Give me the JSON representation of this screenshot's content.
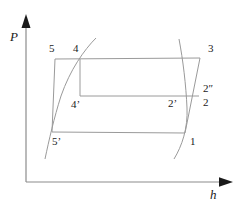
{
  "figure": {
    "type": "thermodynamic-cycle-diagram",
    "background_color": "#ffffff",
    "line_color": "#808080",
    "axis_color": "#808080",
    "text_color": "#1a1a1a"
  },
  "axes": {
    "y": {
      "label": "P",
      "name": "pressure-axis",
      "origin": [
        26,
        182
      ],
      "tip": [
        26,
        16
      ],
      "label_pos": [
        10,
        30
      ]
    },
    "x": {
      "label": "h",
      "name": "enthalpy-axis",
      "origin": [
        26,
        182
      ],
      "tip": [
        232,
        182
      ],
      "label_pos": [
        210,
        188
      ]
    }
  },
  "cycle": {
    "outer_path": [
      [
        55,
        59
      ],
      [
        200,
        58
      ],
      [
        185,
        133
      ],
      [
        52,
        132
      ]
    ],
    "inner_top_line": [
      [
        80,
        96
      ],
      [
        199,
        96
      ]
    ],
    "inner_vertical_line": [
      [
        80,
        59
      ],
      [
        80,
        96
      ]
    ]
  },
  "curves": {
    "saturated_liquid": {
      "name": "left-saturation-curve",
      "path": "M 96,38 C 84,50 70,70 61,96 C 54,118 49,140 45,159"
    },
    "saturated_vapor": {
      "name": "right-saturation-curve",
      "path": "M 179,39 C 183,60 186,85 187,108 C 188,128 182,146 174,159"
    }
  },
  "state_points": [
    {
      "id": "5",
      "label": "5",
      "x": 49,
      "y": 43,
      "name": "state-point-5"
    },
    {
      "id": "4",
      "label": "4",
      "x": 73,
      "y": 43,
      "name": "state-point-4"
    },
    {
      "id": "3",
      "label": "3",
      "x": 208,
      "y": 43,
      "name": "state-point-3"
    },
    {
      "id": "2dp",
      "label": "2″",
      "x": 203,
      "y": 83,
      "name": "state-point-2-double-prime"
    },
    {
      "id": "2",
      "label": "2",
      "x": 203,
      "y": 97,
      "name": "state-point-2"
    },
    {
      "id": "2p",
      "label": "2’",
      "x": 168,
      "y": 98,
      "name": "state-point-2-prime"
    },
    {
      "id": "4p",
      "label": "4’",
      "x": 71,
      "y": 99,
      "name": "state-point-4-prime"
    },
    {
      "id": "5p",
      "label": "5’",
      "x": 52,
      "y": 136,
      "name": "state-point-5-prime"
    },
    {
      "id": "1",
      "label": "1",
      "x": 190,
      "y": 136,
      "name": "state-point-1"
    }
  ]
}
